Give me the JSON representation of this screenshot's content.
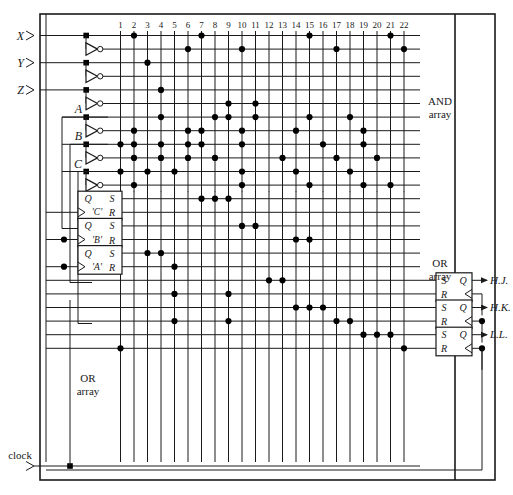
{
  "diagram": {
    "column_numbers": [
      "1",
      "2",
      "3",
      "4",
      "5",
      "6",
      "7",
      "8",
      "9",
      "10",
      "11",
      "12",
      "13",
      "14",
      "15",
      "16",
      "17",
      "18",
      "19",
      "20",
      "21",
      "22"
    ],
    "inputs": [
      {
        "name": "X",
        "label": "X"
      },
      {
        "name": "Y",
        "label": "Y"
      },
      {
        "name": "Z",
        "label": "Z"
      }
    ],
    "feedback_inputs": [
      {
        "name": "A",
        "label": "A"
      },
      {
        "name": "B",
        "label": "B"
      },
      {
        "name": "C",
        "label": "C"
      }
    ],
    "array_labels": {
      "and_array_line1": "AND",
      "and_array_line2": "array",
      "or_array_right_line1": "OR",
      "or_array_right_line2": "array",
      "or_array_left_line1": "OR",
      "or_array_left_line2": "array"
    },
    "state_flipflops": [
      {
        "name": "C-flipflop",
        "q": "Q",
        "s": "S",
        "r": "R",
        "label": "'C'"
      },
      {
        "name": "B-flipflop",
        "q": "Q",
        "s": "S",
        "r": "R",
        "label": "'B'"
      },
      {
        "name": "A-flipflop",
        "q": "Q",
        "s": "S",
        "r": "R",
        "label": "'A'"
      }
    ],
    "output_flipflops": [
      {
        "name": "HJ-flipflop",
        "s": "S",
        "q": "Q",
        "r": "R",
        "output": "H.J."
      },
      {
        "name": "HK-flipflop",
        "s": "S",
        "q": "Q",
        "r": "R",
        "output": "H.K."
      },
      {
        "name": "LL-flipflop",
        "s": "S",
        "q": "Q",
        "r": "R",
        "output": "L.L."
      }
    ],
    "clock": {
      "label": "clock"
    },
    "colors": {
      "ink": "#1a1a1a",
      "paper": "#ffffff",
      "dot": "#000000"
    }
  },
  "chart_data": {
    "type": "diagram",
    "columns": 22,
    "and_array_rows": [
      {
        "row": 1,
        "signal": "X",
        "connections": [
          2,
          7,
          15,
          21
        ]
      },
      {
        "row": 2,
        "signal": "X'",
        "connections": [
          6,
          10,
          17,
          22
        ]
      },
      {
        "row": 3,
        "signal": "Y",
        "connections": [
          3
        ]
      },
      {
        "row": 4,
        "signal": "Y'",
        "connections": []
      },
      {
        "row": 5,
        "signal": "Z",
        "connections": [
          4
        ]
      },
      {
        "row": 6,
        "signal": "Z'",
        "connections": [
          9,
          11
        ]
      },
      {
        "row": 7,
        "signal": "A",
        "connections": [
          4,
          8,
          9,
          11,
          15,
          18
        ]
      },
      {
        "row": 8,
        "signal": "A'",
        "connections": [
          2,
          6,
          7,
          10,
          14,
          19
        ]
      },
      {
        "row": 9,
        "signal": "B",
        "connections": [
          1,
          2,
          4,
          6,
          7,
          10,
          16,
          19
        ]
      },
      {
        "row": 10,
        "signal": "B'",
        "connections": [
          2,
          4,
          6,
          8,
          13,
          17,
          20
        ]
      },
      {
        "row": 11,
        "signal": "C",
        "connections": [
          1,
          3,
          5,
          10,
          14,
          18
        ]
      },
      {
        "row": 12,
        "signal": "C'",
        "connections": [
          2,
          10,
          15,
          19,
          21
        ]
      }
    ],
    "or_array_rows": [
      {
        "row": 13,
        "target": "'C' Q/S",
        "connections": [
          7,
          8,
          9
        ]
      },
      {
        "row": 14,
        "target": "'C' R",
        "connections": []
      },
      {
        "row": 15,
        "target": "'B' Q/S",
        "connections": [
          10,
          11
        ]
      },
      {
        "row": 16,
        "target": "'B' R",
        "connections": [
          14,
          15
        ]
      },
      {
        "row": 17,
        "target": "'A' Q/S",
        "connections": [
          3,
          4
        ]
      },
      {
        "row": 18,
        "target": "'A' R",
        "connections": [
          5
        ]
      },
      {
        "row": 19,
        "target": "HJ S",
        "connections": [
          12,
          13
        ]
      },
      {
        "row": 20,
        "target": "HJ R",
        "connections": [
          5,
          9
        ]
      },
      {
        "row": 21,
        "target": "HK S",
        "connections": [
          14,
          15,
          16
        ]
      },
      {
        "row": 22,
        "target": "HK R",
        "connections": [
          5,
          9,
          17,
          18
        ]
      },
      {
        "row": 23,
        "target": "LL S",
        "connections": [
          19,
          20,
          21
        ]
      },
      {
        "row": 24,
        "target": "LL R",
        "connections": [
          1,
          22
        ]
      }
    ],
    "xlabel": "product term columns 1-22",
    "ylabel": "input / output lines",
    "legend": [
      "AND array",
      "OR array"
    ]
  }
}
